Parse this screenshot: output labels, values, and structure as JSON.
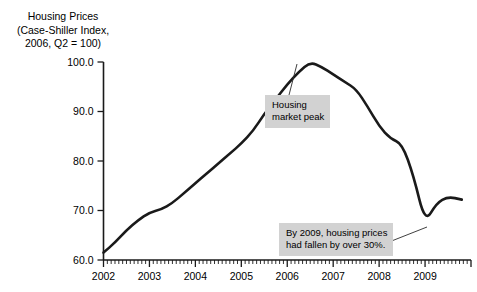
{
  "title": {
    "line1": "Housing Prices",
    "line2": "(Case-Shiller Index,",
    "line3": "2006, Q2 = 100)"
  },
  "annotations": {
    "peak": {
      "line1": "Housing",
      "line2": "market peak"
    },
    "decline": {
      "line1": "By 2009, housing prices",
      "line2": "had fallen by over 30%."
    }
  },
  "colors": {
    "line": "#1a1a1a",
    "callout_background": "#d2d2d2",
    "axis": "#1a1a1a",
    "page_background": "#ffffff"
  },
  "chart_data": {
    "type": "line",
    "title": "Housing Prices (Case-Shiller Index, 2006, Q2 = 100)",
    "xlabel": "",
    "ylabel": "",
    "xlim": [
      2002,
      2010
    ],
    "ylim": [
      60,
      100
    ],
    "yticks": [
      60.0,
      70.0,
      80.0,
      90.0,
      100.0
    ],
    "ytick_labels": [
      "60.0",
      "70.0",
      "80.0",
      "90.0",
      "100.0"
    ],
    "xticks": [
      2002,
      2003,
      2004,
      2005,
      2006,
      2007,
      2008,
      2009
    ],
    "xtick_labels": [
      "2002",
      "2003",
      "2004",
      "2005",
      "2006",
      "2007",
      "2008",
      "2009"
    ],
    "minor_ticks_per_year": 12,
    "grid": false,
    "legend": false,
    "series": [
      {
        "name": "Case-Shiller Home Price Index",
        "x": [
          2002.0,
          2002.25,
          2002.5,
          2002.75,
          2003.0,
          2003.25,
          2003.5,
          2003.75,
          2004.0,
          2004.25,
          2004.5,
          2004.75,
          2005.0,
          2005.25,
          2005.5,
          2005.75,
          2006.0,
          2006.25,
          2006.5,
          2006.75,
          2007.0,
          2007.25,
          2007.5,
          2007.75,
          2008.0,
          2008.25,
          2008.5,
          2008.75,
          2009.0,
          2009.25,
          2009.5,
          2009.8
        ],
        "values": [
          61.5,
          63.5,
          66.0,
          68.0,
          69.6,
          70.2,
          71.5,
          73.5,
          75.5,
          77.5,
          79.5,
          81.5,
          83.5,
          86.0,
          89.5,
          92.5,
          95.5,
          98.0,
          100.0,
          99.0,
          97.5,
          96.0,
          94.5,
          91.0,
          87.0,
          84.5,
          83.5,
          77.0,
          67.5,
          71.5,
          72.8,
          72.2
        ]
      }
    ],
    "annotations": [
      {
        "text": "Housing market peak",
        "points_to_x": 2006.5,
        "points_to_y": 100.0
      },
      {
        "text": "By 2009, housing prices had fallen by over 30%.",
        "points_to_x": 2009.0,
        "points_to_y": 67.5
      }
    ]
  }
}
